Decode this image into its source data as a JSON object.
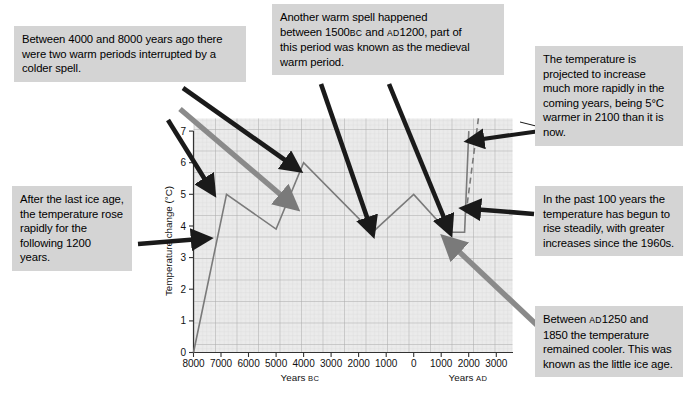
{
  "callouts": {
    "warm_periods": "Between 4000 and 8000 years ago there were two warm periods interrupted by a colder spell.",
    "warm_spell_l1": "Another warm spell happened",
    "warm_spell_l2a": "between 1500",
    "warm_spell_l2b": "BC",
    "warm_spell_l2c": " and ",
    "warm_spell_l2d": "AD",
    "warm_spell_l2e": "1200, part of",
    "warm_spell_l3": "this period was known as the medieval",
    "warm_spell_l4": "warm period.",
    "projection": "The temperature is projected to increase much more rapidly in the coming years, being 5°C warmer in 2100 than it is now.",
    "after_ice_age": "After the last ice age, the temperature rose rapidly for the following 1200 years.",
    "past_100_years": "In the past 100 years the temperature has begun to rise steadily, with greater increases since the 1960s.",
    "little_ice_age_l1a": "Between ",
    "little_ice_age_l1b": "AD",
    "little_ice_age_l1c": "1250 and",
    "little_ice_age_rest": "1850 the temperature remained cooler. This was known as the little ice age."
  },
  "chart_data": {
    "type": "line",
    "title": "",
    "xlabel_left": "Years ",
    "xlabel_left_sc": "BC",
    "xlabel_right": "Years ",
    "xlabel_right_sc": "AD",
    "ylabel": "Temperature change (°C)",
    "ylim": [
      0,
      7.4
    ],
    "yticks": [
      0,
      1,
      2,
      3,
      4,
      5,
      6,
      7
    ],
    "ytick_labels": [
      "0",
      "1",
      "2",
      "3",
      "4",
      "5",
      "6",
      "7"
    ],
    "xlim_years": [
      -8000,
      3600
    ],
    "xticks_years": [
      -8000,
      -7000,
      -6000,
      -5000,
      -4000,
      -3000,
      -2000,
      -1000,
      0,
      1000,
      2000,
      3000
    ],
    "xtick_labels": [
      "8000",
      "7000",
      "6000",
      "5000",
      "4000",
      "3000",
      "2000",
      "1000",
      "0",
      "1000",
      "2000",
      "3000"
    ],
    "grid": true,
    "legend": "none",
    "series": [
      {
        "name": "Temperature change (observed)",
        "style": "solid",
        "color": "#7a7a7a",
        "points": [
          {
            "year": -8000,
            "value": 0.0
          },
          {
            "year": -6800,
            "value": 5.0
          },
          {
            "year": -5000,
            "value": 3.9
          },
          {
            "year": -4000,
            "value": 6.0
          },
          {
            "year": -1500,
            "value": 3.8
          },
          {
            "year": 0,
            "value": 5.0
          },
          {
            "year": 1250,
            "value": 3.8
          },
          {
            "year": 1850,
            "value": 3.8
          },
          {
            "year": 2000,
            "value": 7.0
          }
        ]
      },
      {
        "name": "Projected temperature change",
        "style": "dashed",
        "color": "#7a7a7a",
        "points": [
          {
            "year": 1900,
            "value": 4.4
          },
          {
            "year": 2350,
            "value": 7.4
          }
        ]
      }
    ],
    "annotation_arrows": [
      {
        "label": "warm-periods-arrow-a",
        "color": "#7a7a7a",
        "from": [
          182,
          112
        ],
        "to": [
          292,
          205
        ]
      },
      {
        "label": "warm-periods-arrow-b",
        "color": "#1a1a1a",
        "from": [
          175,
          118
        ],
        "to": [
          213,
          183
        ]
      },
      {
        "label": "warm-periods-arrow-c",
        "color": "#1a1a1a",
        "from": [
          185,
          92
        ],
        "to": [
          290,
          166
        ]
      },
      {
        "label": "warm-spell-arrow-a",
        "color": "#1a1a1a",
        "from": [
          322,
          85
        ],
        "to": [
          368,
          230
        ]
      },
      {
        "label": "warm-spell-arrow-b",
        "color": "#1a1a1a",
        "from": [
          388,
          85
        ],
        "to": [
          448,
          228
        ]
      },
      {
        "label": "projection-arrow",
        "color": "#1a1a1a",
        "from": [
          538,
          132
        ],
        "to": [
          470,
          142
        ]
      },
      {
        "label": "past-100-arrow",
        "color": "#1a1a1a",
        "from": [
          532,
          215
        ],
        "to": [
          468,
          209
        ]
      },
      {
        "label": "after-ice-age-arrow",
        "color": "#1a1a1a",
        "from": [
          140,
          243
        ],
        "to": [
          203,
          238
        ]
      },
      {
        "label": "little-ice-age-arrow",
        "color": "#7a7a7a",
        "from": [
          556,
          340
        ],
        "to": [
          451,
          247
        ]
      }
    ]
  }
}
